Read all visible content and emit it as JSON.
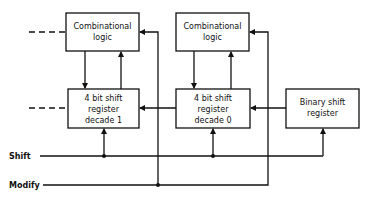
{
  "diagram": {
    "blocks": {
      "comb1": {
        "line1": "Combinational",
        "line2": "logic"
      },
      "comb0": {
        "line1": "Combinational",
        "line2": "logic"
      },
      "sr1": {
        "line1": "4 bit shift",
        "line2": "register",
        "line3": "decade 1"
      },
      "sr0": {
        "line1": "4 bit shift",
        "line2": "register",
        "line3": "decade 0"
      },
      "binary": {
        "line1": "Binary shift",
        "line2": "register"
      }
    },
    "signals": {
      "shift": "Shift",
      "modify": "Modify"
    }
  }
}
